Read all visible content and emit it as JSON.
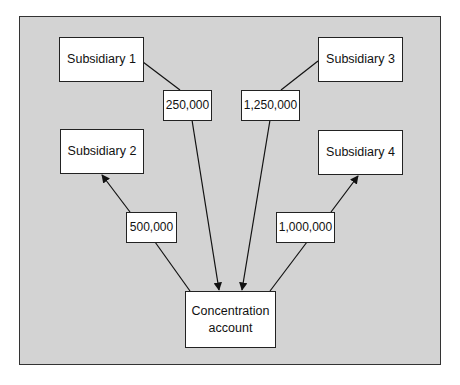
{
  "diagram": {
    "nodes": {
      "subsidiary_1": "Subsidiary 1",
      "subsidiary_2": "Subsidiary 2",
      "subsidiary_3": "Subsidiary 3",
      "subsidiary_4": "Subsidiary 4",
      "concentration_line1": "Concentration",
      "concentration_line2": "account"
    },
    "flows": {
      "sub1_to_concentration": "250,000",
      "sub3_to_concentration": "1,250,000",
      "concentration_to_sub2": "500,000",
      "concentration_to_sub4": "1,000,000"
    },
    "colors": {
      "background": "#d3d3d3",
      "box_fill": "#ffffff",
      "stroke": "#222222"
    }
  }
}
